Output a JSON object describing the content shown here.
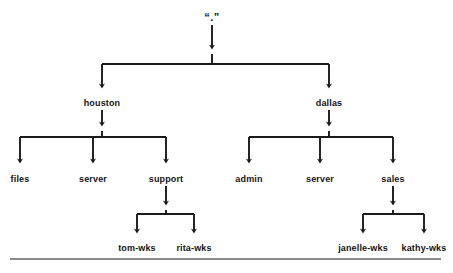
{
  "diagram": {
    "type": "tree",
    "orientation": "top-down",
    "line_color": "#1a1a1a",
    "text_color": "#141414",
    "background_color": "#ffffff",
    "rule_color": "#8a8a8a",
    "nodes": {
      "root": {
        "label": "“.”",
        "x": 212,
        "y": 18
      },
      "houston": {
        "label": "houston",
        "x": 102,
        "y": 104
      },
      "dallas": {
        "label": "dallas",
        "x": 329,
        "y": 104
      },
      "files": {
        "label": "files",
        "x": 20,
        "y": 180
      },
      "houston_server": {
        "label": "server",
        "x": 93,
        "y": 180
      },
      "support": {
        "label": "support",
        "x": 166,
        "y": 180
      },
      "admin": {
        "label": "admin",
        "x": 249,
        "y": 180
      },
      "dallas_server": {
        "label": "server",
        "x": 320,
        "y": 180
      },
      "sales": {
        "label": "sales",
        "x": 393,
        "y": 180
      },
      "tom_wks": {
        "label": "tom-wks",
        "x": 137,
        "y": 249
      },
      "rita_wks": {
        "label": "rita-wks",
        "x": 194,
        "y": 249
      },
      "janelle_wks": {
        "label": "janelle-wks",
        "x": 363,
        "y": 249
      },
      "kathy_wks": {
        "label": "kathy-wks",
        "x": 424,
        "y": 249
      }
    },
    "edges": [
      {
        "from": "root",
        "to": "houston"
      },
      {
        "from": "root",
        "to": "dallas"
      },
      {
        "from": "houston",
        "to": "files"
      },
      {
        "from": "houston",
        "to": "houston_server"
      },
      {
        "from": "houston",
        "to": "support"
      },
      {
        "from": "dallas",
        "to": "admin"
      },
      {
        "from": "dallas",
        "to": "dallas_server"
      },
      {
        "from": "dallas",
        "to": "sales"
      },
      {
        "from": "support",
        "to": "tom_wks"
      },
      {
        "from": "support",
        "to": "rita_wks"
      },
      {
        "from": "sales",
        "to": "janelle_wks"
      },
      {
        "from": "sales",
        "to": "kathy_wks"
      }
    ],
    "footer_rule": {
      "x1": 10,
      "x2": 441,
      "y": 259
    }
  }
}
